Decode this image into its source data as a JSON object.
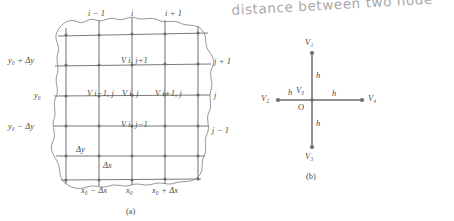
{
  "annotation": {
    "handwritten_note": "distance between two node"
  },
  "figure_a": {
    "caption": "(a)",
    "top_labels": [
      {
        "text": "i − 1",
        "x": 88,
        "y": 9
      },
      {
        "text": "i",
        "x": 131,
        "y": 9
      },
      {
        "text": "i + 1",
        "x": 165,
        "y": 9
      }
    ],
    "right_labels": [
      {
        "text": "j + 1",
        "x": 214,
        "y": 57
      },
      {
        "text": "j",
        "x": 214,
        "y": 93
      },
      {
        "text": "j − 1",
        "x": 212,
        "y": 128
      }
    ],
    "left_labels": [
      {
        "text": "y₀ + Δy",
        "x": 8,
        "y": 56
      },
      {
        "text": "y₀",
        "x": 34,
        "y": 92
      },
      {
        "text": "y₀ − Δy",
        "x": 8,
        "y": 128
      }
    ],
    "bottom_labels": [
      {
        "text": "x₀ − Δx",
        "x": 83,
        "y": 186
      },
      {
        "text": "x₀",
        "x": 129,
        "y": 186
      },
      {
        "text": "x₀ + Δx",
        "x": 155,
        "y": 186
      }
    ],
    "node_labels": [
      {
        "text": "V i, j+1",
        "x": 123,
        "y": 58
      },
      {
        "text": "V i−1, j",
        "x": 89,
        "y": 92
      },
      {
        "text": "V i, j",
        "x": 124,
        "y": 92
      },
      {
        "text": "V i+1, j",
        "x": 157,
        "y": 92
      },
      {
        "text": "V i, j−1",
        "x": 123,
        "y": 126
      }
    ],
    "spacing_labels": [
      {
        "text": "Δy",
        "x": 78,
        "y": 147
      },
      {
        "text": "Δx",
        "x": 104,
        "y": 163
      }
    ]
  },
  "figure_b": {
    "caption": "(b)",
    "nodes": [
      {
        "name": "V1",
        "label": "V₁",
        "position": "top",
        "cx": 312,
        "cy": 53,
        "label_x": 305,
        "label_y": 39
      },
      {
        "name": "V2",
        "label": "V₂",
        "position": "left",
        "cx": 278,
        "cy": 100,
        "label_x": 262,
        "label_y": 95
      },
      {
        "name": "V3",
        "label": "V₃",
        "position": "bottom",
        "cx": 312,
        "cy": 147,
        "label_x": 305,
        "label_y": 152
      },
      {
        "name": "V4",
        "label": "V₄",
        "position": "right",
        "cx": 362,
        "cy": 100,
        "label_x": 368,
        "label_y": 95
      },
      {
        "name": "V0",
        "label": "V₀",
        "position": "center",
        "cx": 312,
        "cy": 100,
        "label_x": 297,
        "label_y": 88
      }
    ],
    "origin_label": {
      "text": "O",
      "x": 299,
      "y": 105
    },
    "spacing_labels": [
      {
        "text": "h",
        "position": "up",
        "x": 317,
        "y": 73
      },
      {
        "text": "h",
        "position": "left",
        "x": 289,
        "y": 89
      },
      {
        "text": "h",
        "position": "right",
        "x": 333,
        "y": 90
      },
      {
        "text": "h",
        "position": "down",
        "x": 317,
        "y": 120
      }
    ]
  },
  "colors": {
    "background": "#ffffff",
    "grid_line": "#7a7a7a",
    "node_dot": "#6e6e6e",
    "boundary": "#8a8a8a",
    "text": "#4a4a4a",
    "handwriting": "#9a9a9a"
  }
}
